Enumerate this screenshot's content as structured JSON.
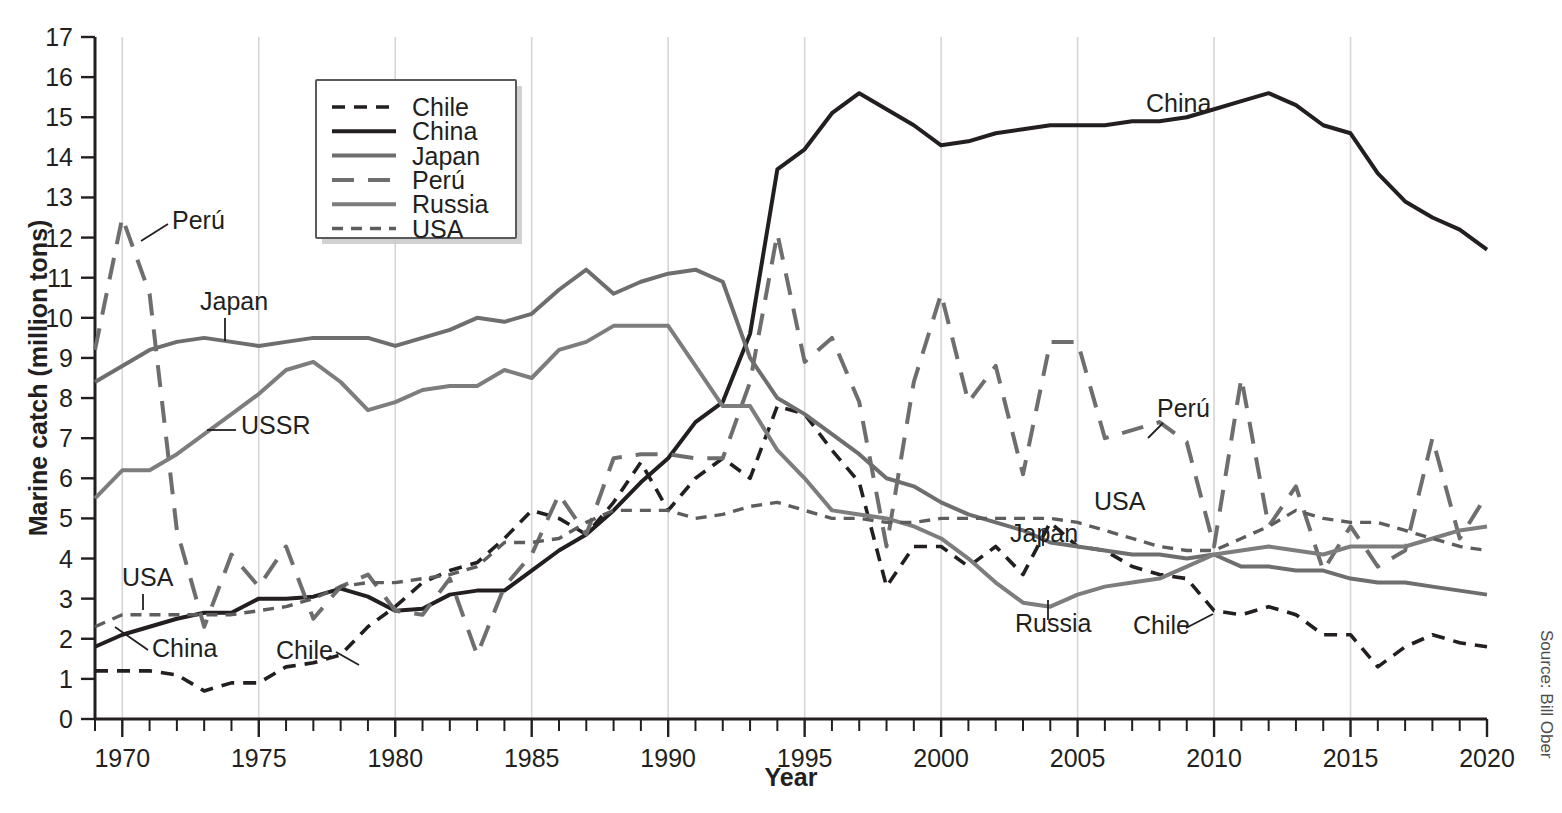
{
  "chart_data": {
    "type": "line",
    "title": "",
    "xlabel": "Year",
    "ylabel": "Marine catch (million tons)",
    "xlim": [
      1969,
      2020
    ],
    "ylim": [
      0,
      17
    ],
    "xticks": [
      1970,
      1975,
      1980,
      1985,
      1990,
      1995,
      2000,
      2005,
      2010,
      2015,
      2020
    ],
    "yticks": [
      0,
      1,
      2,
      3,
      4,
      5,
      6,
      7,
      8,
      9,
      10,
      11,
      12,
      13,
      14,
      15,
      16,
      17
    ],
    "xtick_minor_step": 1,
    "grid": "vertical-only",
    "legend_position": "top-left-inside",
    "source": "Source: Bill Ober",
    "x": [
      1969,
      1970,
      1971,
      1972,
      1973,
      1974,
      1975,
      1976,
      1977,
      1978,
      1979,
      1980,
      1981,
      1982,
      1983,
      1984,
      1985,
      1986,
      1987,
      1988,
      1989,
      1990,
      1991,
      1992,
      1993,
      1994,
      1995,
      1996,
      1997,
      1998,
      1999,
      2000,
      2001,
      2002,
      2003,
      2004,
      2005,
      2006,
      2007,
      2008,
      2009,
      2010,
      2011,
      2012,
      2013,
      2014,
      2015,
      2016,
      2017,
      2018,
      2019,
      2020
    ],
    "series": [
      {
        "name": "Chile",
        "style": "dashed",
        "color": "#231f20",
        "width": 3.6,
        "dasharray": "13,9",
        "values": [
          1.2,
          1.2,
          1.2,
          1.1,
          0.7,
          0.9,
          0.9,
          1.3,
          1.4,
          1.6,
          2.3,
          2.8,
          3.4,
          3.7,
          3.9,
          4.5,
          5.2,
          5.0,
          4.6,
          5.4,
          6.4,
          5.2,
          6.0,
          6.5,
          6.0,
          7.8,
          7.6,
          6.7,
          5.9,
          3.3,
          4.3,
          4.3,
          3.8,
          4.3,
          3.6,
          4.9,
          4.3,
          4.2,
          3.8,
          3.6,
          3.5,
          2.7,
          2.6,
          2.8,
          2.6,
          2.1,
          2.1,
          1.3,
          1.8,
          2.1,
          1.9,
          1.8
        ]
      },
      {
        "name": "China",
        "style": "solid",
        "color": "#231f20",
        "width": 4,
        "dasharray": "",
        "values": [
          1.8,
          2.1,
          2.3,
          2.5,
          2.65,
          2.65,
          3.0,
          3.0,
          3.05,
          3.25,
          3.05,
          2.7,
          2.75,
          3.1,
          3.2,
          3.2,
          3.7,
          4.2,
          4.6,
          5.2,
          5.9,
          6.5,
          7.4,
          7.9,
          9.6,
          13.7,
          14.2,
          15.1,
          15.6,
          15.2,
          14.8,
          14.3,
          14.4,
          14.6,
          14.7,
          14.8,
          14.8,
          14.8,
          14.9,
          14.9,
          15.0,
          15.2,
          15.4,
          15.6,
          15.3,
          14.8,
          14.6,
          13.6,
          12.9,
          12.5,
          12.2,
          11.7
        ]
      },
      {
        "name": "Japan",
        "style": "solid",
        "color": "#6e6e6e",
        "width": 4,
        "dasharray": "",
        "values": [
          8.4,
          8.8,
          9.2,
          9.4,
          9.5,
          9.4,
          9.3,
          9.4,
          9.5,
          9.5,
          9.5,
          9.3,
          9.5,
          9.7,
          10.0,
          9.9,
          10.1,
          10.7,
          11.2,
          10.6,
          10.9,
          11.1,
          11.2,
          10.9,
          9.0,
          8.0,
          7.6,
          7.1,
          6.6,
          6.0,
          5.8,
          5.4,
          5.1,
          4.9,
          4.7,
          4.4,
          4.3,
          4.2,
          4.1,
          4.1,
          4.0,
          4.1,
          3.8,
          3.8,
          3.7,
          3.7,
          3.5,
          3.4,
          3.4,
          3.3,
          3.2,
          3.1
        ]
      },
      {
        "name": "Perú",
        "style": "long-dashed",
        "color": "#6e6e6e",
        "width": 4,
        "dasharray": "22,14",
        "values": [
          9.2,
          12.5,
          10.6,
          4.7,
          2.3,
          4.1,
          3.3,
          4.3,
          2.5,
          3.3,
          3.6,
          2.7,
          2.6,
          3.5,
          1.6,
          3.3,
          4.1,
          5.6,
          4.6,
          6.5,
          6.6,
          6.6,
          6.5,
          6.5,
          8.4,
          12.1,
          8.9,
          9.5,
          7.9,
          4.3,
          8.4,
          10.6,
          7.9,
          8.8,
          6.1,
          9.4,
          9.4,
          7.0,
          7.2,
          7.4,
          6.9,
          4.3,
          8.5,
          4.8,
          5.8,
          3.7,
          4.8,
          3.8,
          4.2,
          7.0,
          4.5,
          5.6
        ]
      },
      {
        "name": "Russia",
        "style": "solid",
        "color": "#7d7d7d",
        "width": 4,
        "dasharray": "",
        "values": [
          5.5,
          6.2,
          6.2,
          6.6,
          7.1,
          7.6,
          8.1,
          8.7,
          8.9,
          8.4,
          7.7,
          7.9,
          8.2,
          8.3,
          8.3,
          8.7,
          8.5,
          9.2,
          9.4,
          9.8,
          9.8,
          9.8,
          8.8,
          7.8,
          7.8,
          6.7,
          6.0,
          5.2,
          5.1,
          5.0,
          4.8,
          4.5,
          4.0,
          3.4,
          2.9,
          2.8,
          3.1,
          3.3,
          3.4,
          3.5,
          3.8,
          4.1,
          4.2,
          4.3,
          4.2,
          4.1,
          4.3,
          4.3,
          4.3,
          4.5,
          4.7,
          4.8
        ]
      },
      {
        "name": "USA",
        "style": "small-dashed",
        "color": "#5d5d5d",
        "width": 3.4,
        "dasharray": "11,8",
        "values": [
          2.3,
          2.6,
          2.6,
          2.6,
          2.6,
          2.6,
          2.7,
          2.8,
          3.0,
          3.3,
          3.4,
          3.4,
          3.5,
          3.6,
          3.8,
          4.4,
          4.4,
          4.5,
          4.9,
          5.2,
          5.2,
          5.2,
          5.0,
          5.1,
          5.3,
          5.4,
          5.2,
          5.0,
          5.0,
          4.9,
          4.9,
          5.0,
          5.0,
          5.0,
          5.0,
          5.0,
          4.9,
          4.7,
          4.5,
          4.3,
          4.2,
          4.2,
          4.5,
          4.8,
          5.2,
          5.0,
          4.9,
          4.9,
          4.7,
          4.5,
          4.3,
          4.2
        ]
      }
    ],
    "annotations": [
      {
        "name": "peru-left",
        "label": "Perú",
        "x": 172,
        "y": 229
      },
      {
        "name": "japan-left",
        "label": "Japan",
        "x": 200,
        "y": 310
      },
      {
        "name": "ussr-left",
        "label": "USSR",
        "x": 241,
        "y": 434
      },
      {
        "name": "usa-left",
        "label": "USA",
        "x": 122,
        "y": 586
      },
      {
        "name": "china-left",
        "label": "China",
        "x": 152,
        "y": 657
      },
      {
        "name": "chile-left",
        "label": "Chile",
        "x": 276,
        "y": 659
      },
      {
        "name": "china-right",
        "label": "China",
        "x": 1146,
        "y": 112
      },
      {
        "name": "peru-right",
        "label": "Perú",
        "x": 1157,
        "y": 417
      },
      {
        "name": "usa-right",
        "label": "USA",
        "x": 1094,
        "y": 510
      },
      {
        "name": "japan-right",
        "label": "Japan",
        "x": 1010,
        "y": 542
      },
      {
        "name": "russia-right",
        "label": "Russia",
        "x": 1015,
        "y": 632
      },
      {
        "name": "chile-right",
        "label": "Chile",
        "x": 1133,
        "y": 634
      }
    ]
  },
  "legend": {
    "items": [
      {
        "label": "Chile"
      },
      {
        "label": "China"
      },
      {
        "label": "Japan"
      },
      {
        "label": "Perú"
      },
      {
        "label": "Russia"
      },
      {
        "label": "USA"
      }
    ]
  },
  "axes": {
    "x_title": "Year",
    "y_title": "Marine catch (million tons)"
  },
  "source": {
    "text": "Source: Bill Ober"
  },
  "colors": {
    "chile": "#231f20",
    "china": "#231f20",
    "japan": "#6e6e6e",
    "peru": "#6e6e6e",
    "russia": "#7d7d7d",
    "usa": "#5d5d5d",
    "grid": "#d6d6d6",
    "axis": "#231f20"
  }
}
